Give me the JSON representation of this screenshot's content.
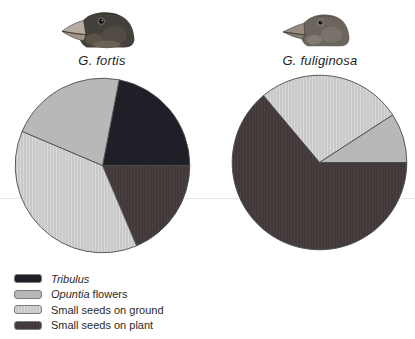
{
  "figure": {
    "description_visible_text_only": "",
    "background": "#ffffff"
  },
  "panels": [
    {
      "species": "G. fortis",
      "bird_icon": "large-ground-finch-head-photo"
    },
    {
      "species": "G. fuliginosa",
      "bird_icon": "small-ground-finch-head-photo"
    }
  ],
  "legend": {
    "items": [
      {
        "key": "tribulus",
        "label_italic": "Tribulus",
        "label_rest": ""
      },
      {
        "key": "opuntia",
        "label_italic": "Opuntia",
        "label_rest": " flowers"
      },
      {
        "key": "ground",
        "label_italic": "",
        "label_rest": "Small seeds on ground"
      },
      {
        "key": "plant",
        "label_italic": "",
        "label_rest": "Small seeds on plant"
      }
    ]
  },
  "colors": {
    "tribulus": "#201f27",
    "opuntia": "#b8b8b8",
    "ground_base": "#c8c8c8",
    "ground_stripe": "#d9d9d9",
    "plant_base": "#413939",
    "plant_stripe": "#4a4040",
    "outline": "#4c4c4c",
    "artifact_line": "#e2e2e2"
  },
  "chart_data": [
    {
      "type": "pie",
      "title": "G. fortis",
      "legend_position": "bottom-left",
      "slices": [
        {
          "label": "Tribulus",
          "key": "tribulus",
          "percent": 21.9,
          "start_deg": 11,
          "sweep_deg": 79
        },
        {
          "label": "Small seeds on plant",
          "key": "plant",
          "percent": 18.6,
          "start_deg": 90,
          "sweep_deg": 67
        },
        {
          "label": "Small seeds on ground",
          "key": "ground",
          "percent": 37.8,
          "start_deg": 157,
          "sweep_deg": 136
        },
        {
          "label": "Opuntia flowers",
          "key": "opuntia",
          "percent": 21.7,
          "start_deg": 293,
          "sweep_deg": 78
        }
      ]
    },
    {
      "type": "pie",
      "title": "G. fuliginosa",
      "legend_position": "shared",
      "slices": [
        {
          "label": "Small seeds on ground",
          "key": "ground",
          "percent": 26.9,
          "start_deg": 320,
          "sweep_deg": 97
        },
        {
          "label": "Opuntia flowers",
          "key": "opuntia",
          "percent": 9.2,
          "start_deg": 57,
          "sweep_deg": 33
        },
        {
          "label": "Small seeds on plant",
          "key": "plant",
          "percent": 63.9,
          "start_deg": 90,
          "sweep_deg": 230
        }
      ]
    }
  ]
}
